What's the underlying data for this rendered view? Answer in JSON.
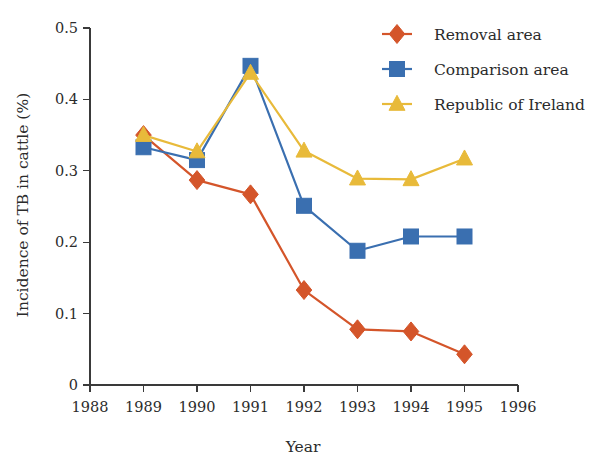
{
  "chart_data": {
    "type": "line",
    "title": "",
    "xlabel": "Year",
    "ylabel": "Incidence of TB in cattle (%)",
    "x": [
      1989,
      1990,
      1991,
      1992,
      1993,
      1994,
      1995
    ],
    "xticks": [
      1988,
      1989,
      1990,
      1991,
      1992,
      1993,
      1994,
      1995,
      1996
    ],
    "xticklabels": [
      "1988",
      "1989",
      "1990",
      "1991",
      "1992",
      "1993",
      "1994",
      "1995",
      "1996"
    ],
    "xlim": [
      1988,
      1996
    ],
    "yticks": [
      0,
      0.1,
      0.2,
      0.3,
      0.4,
      0.5
    ],
    "yticklabels": [
      "0",
      "0.1",
      "0.2",
      "0.3",
      "0.4",
      "0.5"
    ],
    "ylim": [
      0,
      0.5
    ],
    "grid": false,
    "legend_position": "top-right",
    "series": [
      {
        "name": "Removal area",
        "color": "#D4552A",
        "marker": "diamond",
        "values": [
          0.35,
          0.287,
          0.267,
          0.133,
          0.078,
          0.075,
          0.043
        ]
      },
      {
        "name": "Comparison area",
        "color": "#3A6FB0",
        "marker": "square",
        "values": [
          0.333,
          0.315,
          0.447,
          0.251,
          0.188,
          0.208,
          0.208
        ]
      },
      {
        "name": "Republic of Ireland",
        "color": "#E8BA3A",
        "marker": "triangle",
        "values": [
          0.35,
          0.327,
          0.437,
          0.328,
          0.289,
          0.288,
          0.317
        ]
      }
    ]
  },
  "legend": {
    "items": [
      {
        "label": "Removal area"
      },
      {
        "label": "Comparison area"
      },
      {
        "label": "Republic of Ireland"
      }
    ]
  }
}
